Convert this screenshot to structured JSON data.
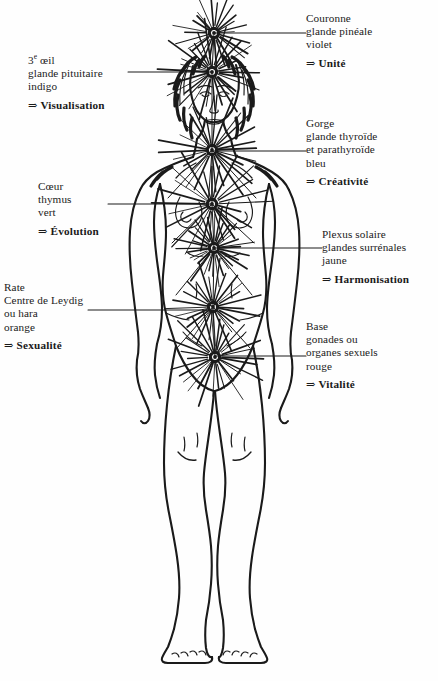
{
  "document": {
    "title": "Les sept chakras",
    "type": "anatomical-diagram",
    "language": "fr",
    "background_color": "#fefefe",
    "ink_color": "#1a1a1a"
  },
  "figure": {
    "name": "human-body-front-view"
  },
  "arrow_glyph": "⇒",
  "labels": [
    {
      "id": "crown",
      "side": "right",
      "name": "Couronne",
      "gland": "glande pinéale",
      "color": "violet",
      "keyword": "Unité",
      "lines": [
        "Couronne",
        "glande pinéale",
        "violet"
      ]
    },
    {
      "id": "third-eye",
      "side": "left",
      "name": "3e œil",
      "gland": "glande pituitaire",
      "color": "indigo",
      "keyword": "Visualisation",
      "lines": [
        "glande pituitaire",
        "indigo"
      ]
    },
    {
      "id": "throat",
      "side": "right",
      "name": "Gorge",
      "gland": "glande thyroïde et parathyroïde",
      "color": "bleu",
      "keyword": "Créativité",
      "lines": [
        "Gorge",
        "glande thyroïde",
        "et parathyroïde",
        "bleu"
      ]
    },
    {
      "id": "heart",
      "side": "left",
      "name": "Cœur",
      "gland": "thymus",
      "color": "vert",
      "keyword": "Évolution",
      "lines": [
        "Cœur",
        "thymus",
        "vert"
      ]
    },
    {
      "id": "plexus",
      "side": "right",
      "name": "Plexus solaire",
      "gland": "glandes surrénales",
      "color": "jaune",
      "keyword": "Harmonisation",
      "lines": [
        "Plexus solaire",
        "glandes surrénales",
        "jaune"
      ]
    },
    {
      "id": "spleen",
      "side": "left",
      "name": "Rate",
      "gland": "Centre de Leydig ou hara",
      "color": "orange",
      "keyword": "Sexualité",
      "lines": [
        "Rate",
        "Centre de Leydig",
        "ou hara",
        "orange"
      ]
    },
    {
      "id": "base",
      "side": "right",
      "name": "Base",
      "gland": "gonades ou organes sexuels",
      "color": "rouge",
      "keyword": "Vitalité",
      "lines": [
        "Base",
        "gonades ou",
        "organes sexuels",
        "rouge"
      ]
    }
  ],
  "chakra_points": [
    {
      "id": "crown",
      "x": 214,
      "y": 33,
      "rays": 26,
      "radius": 34,
      "leader_to_x": 306,
      "leader_y": 33
    },
    {
      "id": "third-eye",
      "x": 212,
      "y": 72,
      "rays": 30,
      "radius": 46,
      "leader_to_x": 128,
      "leader_y": 72
    },
    {
      "id": "throat",
      "x": 212,
      "y": 150,
      "rays": 26,
      "radius": 48,
      "leader_to_x": 306,
      "leader_y": 151
    },
    {
      "id": "heart",
      "x": 212,
      "y": 204,
      "rays": 24,
      "radius": 52,
      "leader_to_x": 108,
      "leader_y": 204
    },
    {
      "id": "plexus",
      "x": 214,
      "y": 248,
      "rays": 32,
      "radius": 34,
      "leader_to_x": 322,
      "leader_y": 248
    },
    {
      "id": "spleen",
      "x": 213,
      "y": 307,
      "rays": 26,
      "radius": 40,
      "leader_to_x": 88,
      "leader_y": 310
    },
    {
      "id": "base",
      "x": 215,
      "y": 357,
      "rays": 30,
      "radius": 44,
      "leader_to_x": 306,
      "leader_y": 356
    }
  ]
}
